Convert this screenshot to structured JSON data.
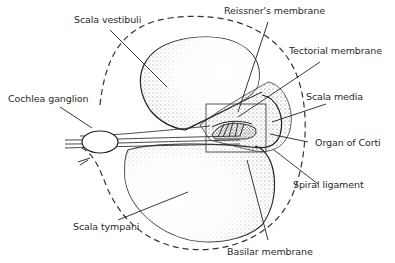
{
  "diagram": {
    "labels": {
      "scala_vestibuli": "Scala vestibuli",
      "reissners_membrane": "Reissner's membrane",
      "tectorial_membrane": "Tectorial membrane",
      "cochlea_ganglion": "Cochlea ganglion",
      "scala_media": "Scala media",
      "organ_of_corti": "Organ of Corti",
      "spiral_ligament": "Spiral ligament",
      "scala_tympani": "Scala tympani",
      "basilar_membrane": "Basilar membrane"
    },
    "colors": {
      "ink": "#2a2a2a",
      "stipple": "#555555",
      "background": "#ffffff"
    }
  }
}
